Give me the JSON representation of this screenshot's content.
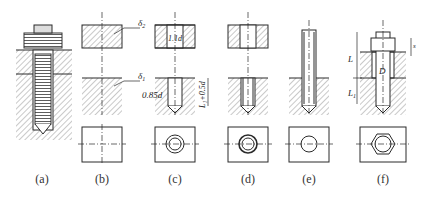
{
  "figure": {
    "top_clip_text": "",
    "panels": [
      {
        "id": "a",
        "caption": "(a)"
      },
      {
        "id": "b",
        "caption": "(b)",
        "labels": {
          "delta2": "δ",
          "delta2_sub": "2",
          "delta1": "δ",
          "delta1_sub": "1"
        }
      },
      {
        "id": "c",
        "caption": "(c)",
        "labels": {
          "clearance": "1.1d",
          "drill": "0.85d",
          "depth": "L₁+0.5d"
        }
      },
      {
        "id": "d",
        "caption": "(d)"
      },
      {
        "id": "e",
        "caption": "(e)"
      },
      {
        "id": "f",
        "caption": "(f)",
        "labels": {
          "L": "L",
          "L1": "L",
          "L1_sub": "1",
          "D": "D",
          "s": "s"
        }
      }
    ]
  },
  "colors": {
    "line": "#2a2a2a",
    "hatch": "#888888",
    "background": "#ffffff"
  }
}
